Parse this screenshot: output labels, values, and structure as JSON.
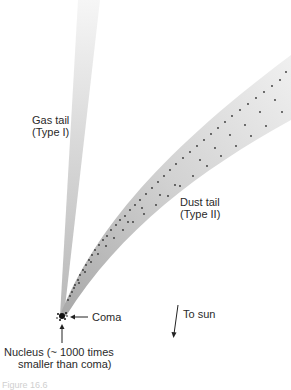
{
  "diagram": {
    "labels": {
      "gas_tail_line1": "Gas tail",
      "gas_tail_line2": "(Type I)",
      "dust_tail_line1": "Dust tail",
      "dust_tail_line2": "(Type II)",
      "coma": "Coma",
      "to_sun": "To sun",
      "nucleus_line1": "Nucleus (~ 1000 times",
      "nucleus_line2": "smaller than coma)"
    },
    "caption": "Figure 16.6",
    "colors": {
      "gas_tail": "#c8c8c8",
      "dust_tail_band": "#d4d4d4",
      "dust_particles": "#333333",
      "text": "#2a2a2a"
    }
  }
}
